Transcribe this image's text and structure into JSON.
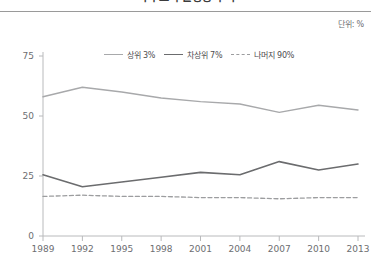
{
  "header": {
    "title": "미국 소득 불평등 추이",
    "unit_label": "단위: %"
  },
  "legend": {
    "position": "top-center",
    "entries": [
      {
        "label": "상위 3%",
        "style": "solid-light",
        "color": "#a8a9ab"
      },
      {
        "label": "차상위 7%",
        "style": "solid-dark",
        "color": "#6b6c6e"
      },
      {
        "label": "나머지 90%",
        "style": "dashed",
        "color": "#9c9d9f"
      }
    ]
  },
  "chart_data": {
    "type": "line",
    "title": "미국 소득 불평등 추이",
    "subtitle": "",
    "xlabel": "",
    "ylabel": "",
    "unit": "%",
    "grid": false,
    "legend_position": "top-center",
    "x": [
      "1989",
      "1992",
      "1995",
      "1998",
      "2001",
      "2004",
      "2007",
      "2010",
      "2013"
    ],
    "xlim": [
      0,
      8
    ],
    "ylim": [
      0,
      75
    ],
    "yticks": [
      0,
      25,
      50,
      75
    ],
    "series": [
      {
        "name": "상위 3%",
        "style": "solid",
        "color": "#a8a9ab",
        "values": [
          58.0,
          62.0,
          60.0,
          57.5,
          56.0,
          55.0,
          51.5,
          54.5,
          52.5
        ]
      },
      {
        "name": "차상위 7%",
        "style": "solid",
        "color": "#6b6c6e",
        "values": [
          25.5,
          20.5,
          22.5,
          24.5,
          26.5,
          25.5,
          31.0,
          27.5,
          30.0
        ]
      },
      {
        "name": "나머지 90%",
        "style": "dashed",
        "color": "#9c9d9f",
        "values": [
          16.5,
          17.0,
          16.5,
          16.5,
          16.0,
          16.0,
          15.5,
          16.0,
          16.0
        ]
      }
    ]
  }
}
